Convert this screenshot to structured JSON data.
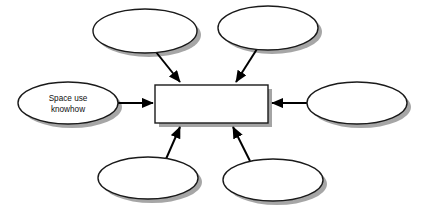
{
  "diagram": {
    "canvas": {
      "width": 424,
      "height": 213,
      "background": "#ffffff"
    },
    "style": {
      "shape_fill": "#ffffff",
      "shape_stroke": "#1a1a1a",
      "shadow_color": "#9a9a9a",
      "arrow_color": "#000000",
      "text_color": "#101010"
    },
    "center": {
      "id": "center-box",
      "shape": "rectangle",
      "label": "",
      "x": 155,
      "y": 85,
      "width": 113,
      "height": 38
    },
    "nodes": [
      {
        "id": "node-top-left",
        "shape": "ellipse",
        "label": "",
        "cx": 145,
        "cy": 31,
        "rx": 52,
        "ry": 22,
        "position": "top-left"
      },
      {
        "id": "node-top-right",
        "shape": "ellipse",
        "label": "",
        "cx": 268,
        "cy": 28,
        "rx": 50,
        "ry": 22,
        "position": "top-right"
      },
      {
        "id": "node-right",
        "shape": "ellipse",
        "label": "",
        "cx": 357,
        "cy": 103,
        "rx": 50,
        "ry": 21,
        "position": "right"
      },
      {
        "id": "node-bottom-right",
        "shape": "ellipse",
        "label": "",
        "cx": 273,
        "cy": 180,
        "rx": 50,
        "ry": 21,
        "position": "bottom-right"
      },
      {
        "id": "node-bottom-left",
        "shape": "ellipse",
        "label": "",
        "cx": 148,
        "cy": 178,
        "rx": 50,
        "ry": 21,
        "position": "bottom-left"
      },
      {
        "id": "node-left",
        "shape": "ellipse",
        "label": "Space use\nknowhow",
        "label_line1": "Space use",
        "label_line2": "knowhow",
        "cx": 68,
        "cy": 103,
        "rx": 50,
        "ry": 21,
        "position": "left"
      }
    ],
    "connectors": [
      {
        "id": "arrow-top-left",
        "from": "node-top-left",
        "to": "center-box",
        "direction": "down-right"
      },
      {
        "id": "arrow-top-right",
        "from": "node-top-right",
        "to": "center-box",
        "direction": "down-left"
      },
      {
        "id": "arrow-right",
        "from": "node-right",
        "to": "center-box",
        "direction": "left"
      },
      {
        "id": "arrow-bottom-right",
        "from": "node-bottom-right",
        "to": "center-box",
        "direction": "up-left"
      },
      {
        "id": "arrow-bottom-left",
        "from": "node-bottom-left",
        "to": "center-box",
        "direction": "up-right"
      },
      {
        "id": "arrow-left",
        "from": "node-left",
        "to": "center-box",
        "direction": "right"
      }
    ]
  }
}
